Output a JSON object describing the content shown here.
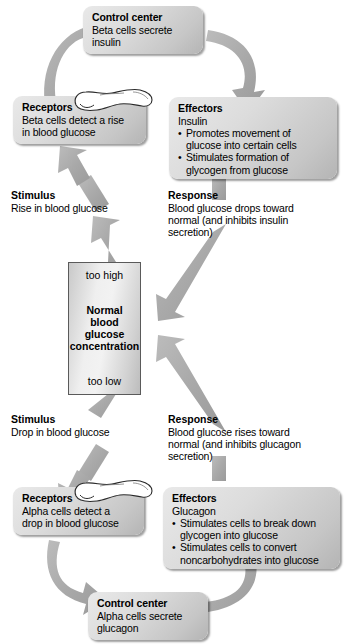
{
  "diagram": {
    "center": {
      "top_label": "too high",
      "bottom_label": "too low",
      "main_line1": "Normal",
      "main_line2": "blood glucose",
      "main_line3": "concentration"
    },
    "upper_loop": {
      "control_center": {
        "heading": "Control center",
        "line1": "Beta cells secrete",
        "line2": "insulin"
      },
      "receptors": {
        "heading": "Receptors",
        "line1": "Beta cells detect a rise",
        "line2": "in blood glucose"
      },
      "effectors": {
        "heading": "Effectors",
        "subject": "Insulin",
        "bullets": [
          {
            "line1": "Promotes movement of",
            "line2": "glucose into certain cells"
          },
          {
            "line1": "Stimulates formation of",
            "line2": "glycogen from glucose"
          }
        ]
      },
      "stimulus": {
        "heading": "Stimulus",
        "line1": "Rise in blood glucose"
      },
      "response": {
        "heading": "Response",
        "line1": "Blood glucose drops toward",
        "line2": "normal (and inhibits insulin",
        "line3": "secretion)"
      }
    },
    "lower_loop": {
      "control_center": {
        "heading": "Control center",
        "line1": "Alpha cells secrete",
        "line2": "glucagon"
      },
      "receptors": {
        "heading": "Receptors",
        "line1": "Alpha cells detect a",
        "line2": "drop in blood glucose"
      },
      "effectors": {
        "heading": "Effectors",
        "subject": "Glucagon",
        "bullets": [
          {
            "line1": "Stimulates cells to break down",
            "line2": "glycogen into glucose"
          },
          {
            "line1": "Stimulates cells to convert",
            "line2": "noncarbohydrates into glucose"
          }
        ]
      },
      "stimulus": {
        "heading": "Stimulus",
        "line1": "Drop in blood glucose"
      },
      "response": {
        "heading": "Response",
        "line1": "Blood glucose rises toward",
        "line2": "normal (and inhibits glucagon",
        "line3": "secretion)"
      }
    },
    "organ_icon": "pancreas-icon",
    "colors": {
      "arrow": "#a8a8a8",
      "box_light": "#e9e9e9",
      "box_dark": "#b4b4b4",
      "text": "#000000",
      "background": "#ffffff"
    }
  }
}
